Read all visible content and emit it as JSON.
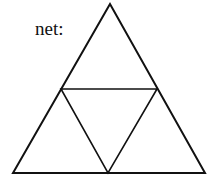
{
  "diagram": {
    "label": "net:",
    "stroke_color": "#111111",
    "outer_triangle": {
      "apex": [
        110,
        4
      ],
      "bottom_left": [
        13,
        173
      ],
      "bottom_right": [
        205,
        173
      ]
    },
    "inner_triangle": {
      "left": [
        61,
        89
      ],
      "right": [
        157,
        89
      ],
      "bottom": [
        108,
        173
      ]
    }
  }
}
